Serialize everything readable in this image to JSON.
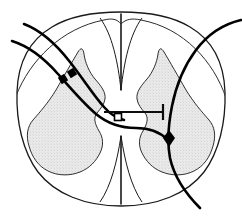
{
  "figure": {
    "title": "Spinal cord cross-section with nerve fibre pathways",
    "caption": "",
    "width": 242,
    "height": 219,
    "background_color": "#ffffff"
  },
  "colors": {
    "outline_stroke": "#1a1a1a",
    "gray_matter_fill": "#e6e6e6",
    "gray_matter_stroke": "#1a1a1a",
    "white_matter_fill": "#ffffff",
    "fiber_stroke": "#000000",
    "marker_fill": "#000000"
  },
  "anatomy": {
    "cord_outline": {
      "label": "spinal-cord-outline",
      "stroke_width": 1.2
    },
    "gray_matter": {
      "label": "gray-matter-butterfly",
      "description": "Butterfly shaped central gray matter, stippled light gray",
      "stroke_width": 1.0
    },
    "dorsal_median_sulcus": {
      "label": "dorsal-median-sulcus",
      "position": "top-center",
      "depth_px": 78
    },
    "ventral_median_fissure": {
      "label": "ventral-median-fissure",
      "position": "bottom-center",
      "depth_px": 72
    }
  },
  "fibers": [
    {
      "id": "fiber-upper-left-afferent",
      "label": "Upper left afferent fibre",
      "entry": "upper-left",
      "exit": "center-commissure",
      "stroke_width": 2.6
    },
    {
      "id": "fiber-lower-left-afferent",
      "label": "Lower left afferent fibre",
      "entry": "mid-left",
      "exit": "center-commissure",
      "stroke_width": 2.6
    },
    {
      "id": "fiber-right-descending",
      "label": "Right descending fibre",
      "entry": "upper-right",
      "exit": "lower-right",
      "stroke_width": 2.6
    },
    {
      "id": "fiber-thin-dorsal-left",
      "label": "Thin dorsal arc left",
      "entry": "left-margin",
      "exit": "dorsal-midline",
      "stroke_width": 1.0
    },
    {
      "id": "fiber-thin-dorsal-right",
      "label": "Thin dorsal arc right",
      "entry": "dorsal-midline",
      "exit": "right-margin",
      "stroke_width": 1.0
    }
  ],
  "markers": [
    {
      "id": "synapse-left-outer",
      "label": "Synaptic bouton, left outer fibre",
      "shape": "filled-square",
      "x": 63,
      "y": 79
    },
    {
      "id": "synapse-left-inner",
      "label": "Synaptic bouton, left inner fibre",
      "shape": "filled-square",
      "x": 72,
      "y": 73
    },
    {
      "id": "synapse-central",
      "label": "Synaptic bouton, central commissure",
      "shape": "open-square",
      "x": 118,
      "y": 117
    },
    {
      "id": "synapse-right-ventral",
      "label": "Synaptic bouton, right descending fibre",
      "shape": "filled-diamond",
      "x": 169,
      "y": 138
    }
  ],
  "terminal_bar": {
    "id": "commissural-terminal-bar",
    "label": "Commissural fibre with T terminal bar",
    "from_x": 104,
    "to_x": 163,
    "y": 112,
    "bar_height": 16,
    "stroke_width": 2.2
  }
}
